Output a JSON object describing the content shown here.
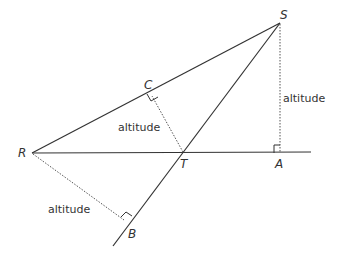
{
  "diagram": {
    "colors": {
      "line": "#333333",
      "dotted": "#555555",
      "background": "#ffffff"
    },
    "points": {
      "R": {
        "label": "R",
        "x": 32,
        "y": 153
      },
      "S": {
        "label": "S",
        "x": 280,
        "y": 23
      },
      "T": {
        "label": "T",
        "x": 183,
        "y": 153
      },
      "A": {
        "label": "A",
        "x": 280,
        "y": 153
      },
      "B": {
        "label": "B",
        "x": 127,
        "y": 223
      },
      "C": {
        "label": "C",
        "x": 150,
        "y": 92
      }
    },
    "altitude_labels": {
      "SA": "altitude",
      "TC": "altitude",
      "RB": "altitude"
    }
  }
}
